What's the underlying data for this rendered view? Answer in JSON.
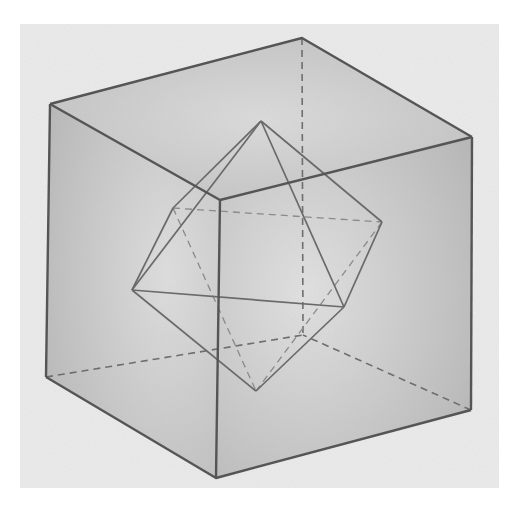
{
  "image": {
    "subject": "Pencil drawing of a transparent cube with an octahedron inscribed inside",
    "paper_color": "#ededed",
    "background_color": "#ffffff",
    "line_color": "#5a5a5a",
    "hidden_line_color": "#7a7a7a",
    "shade_color": "#9a9a9a"
  },
  "cube": {
    "vertices": {
      "top_left": [
        50,
        104
      ],
      "top_back": [
        302,
        38
      ],
      "top_right": [
        472,
        137
      ],
      "top_front": [
        220,
        200
      ],
      "bottom_left": [
        46,
        377
      ],
      "bottom_back": [
        303,
        335
      ],
      "bottom_right": [
        471,
        410
      ],
      "bottom_front": [
        216,
        478
      ]
    }
  },
  "octahedron": {
    "vertices": {
      "top": [
        261,
        121
      ],
      "bottom": [
        256,
        391
      ],
      "left": [
        132,
        290
      ],
      "front_right": [
        344,
        307
      ],
      "back_right": [
        382,
        222
      ],
      "back_left": [
        173,
        208
      ]
    }
  }
}
